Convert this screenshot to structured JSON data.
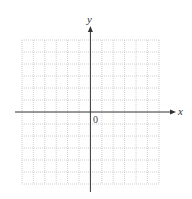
{
  "diagram": {
    "type": "coordinate-grid",
    "x_axis_label": "x",
    "y_axis_label": "y",
    "origin_label": "0",
    "grid": {
      "columns": 12,
      "rows": 12,
      "style": "dotted"
    },
    "colors": {
      "axis": "#333333",
      "grid": "#c8c8c8",
      "background": "#ffffff"
    }
  }
}
